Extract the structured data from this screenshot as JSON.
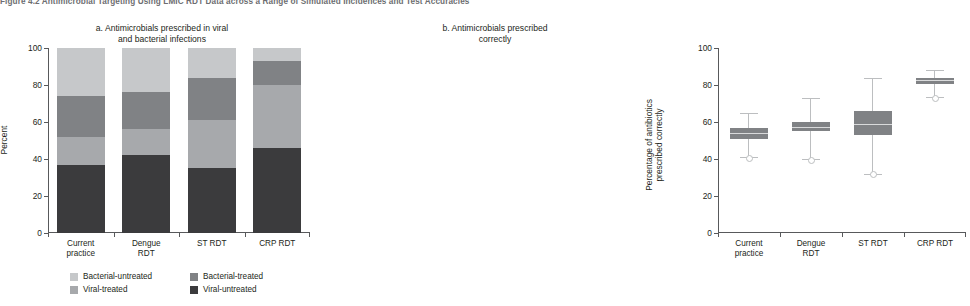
{
  "figure": {
    "title": "Figure 4.2 Antimicrobial Targeting Using LMIC RDT Data across a Range of Simulated Incidences and Test Accuracies"
  },
  "colors": {
    "bacterial_untreated": "#c6c8ca",
    "bacterial_treated": "#808285",
    "viral_treated": "#a7a9ac",
    "viral_untreated": "#3b3b3d",
    "box_fill": "#808285",
    "whisker": "#bcbec0",
    "axis": "#58595b",
    "text": "#231f20",
    "title_gray": "#6d6e71"
  },
  "legend": {
    "items": [
      {
        "label": "Bacterial-untreated",
        "color": "#c6c8ca",
        "key": "bacterial_untreated"
      },
      {
        "label": "Bacterial-treated",
        "color": "#808285",
        "key": "bacterial_treated"
      },
      {
        "label": "Viral-treated",
        "color": "#a7a9ac",
        "key": "viral_treated"
      },
      {
        "label": "Viral-untreated",
        "color": "#3b3b3d",
        "key": "viral_untreated"
      }
    ]
  },
  "chart_data": [
    {
      "id": "panel-a",
      "type": "bar",
      "title": "a. Antimicrobials prescribed in viral and bacterial infections",
      "title_line1": "a. Antimicrobials prescribed in viral",
      "title_line2": "and bacterial infections",
      "stacked": true,
      "xlabel": "",
      "ylabel": "Percent",
      "ylim": [
        0,
        100
      ],
      "yticks": [
        0,
        20,
        40,
        60,
        80,
        100
      ],
      "ytick_labels": [
        "0",
        "20",
        "40",
        "60",
        "80",
        "100"
      ],
      "grid": false,
      "legend_position": "below",
      "categories": [
        "Current practice",
        "Dengue RDT",
        "ST RDT",
        "CRP RDT"
      ],
      "category_lines": [
        [
          "Current",
          "practice"
        ],
        [
          "Dengue",
          "RDT"
        ],
        [
          "ST RDT",
          ""
        ],
        [
          "CRP RDT",
          ""
        ]
      ],
      "series": [
        {
          "name": "Viral-untreated",
          "color": "#3b3b3d",
          "values": [
            37,
            42,
            35,
            46
          ]
        },
        {
          "name": "Viral-treated",
          "color": "#a7a9ac",
          "values": [
            15,
            14,
            26,
            34
          ]
        },
        {
          "name": "Bacterial-treated",
          "color": "#808285",
          "values": [
            22,
            20,
            23,
            13
          ]
        },
        {
          "name": "Bacterial-untreated",
          "color": "#c6c8ca",
          "values": [
            26,
            24,
            16,
            7
          ]
        }
      ],
      "cumulative_tops": [
        [
          37,
          52,
          74,
          100
        ],
        [
          42,
          56,
          76,
          100
        ],
        [
          35,
          61,
          84,
          100
        ],
        [
          46,
          80,
          93,
          100
        ]
      ]
    },
    {
      "id": "panel-b",
      "type": "boxplot",
      "title": "b. Antimicrobials prescribed correctly",
      "title_line1": "b. Antimicrobials prescribed",
      "title_line2": "correctly",
      "xlabel": "",
      "ylabel": "Percentage of antibiotics prescribed correctly",
      "ylabel_line1": "Percentage of antibiotics",
      "ylabel_line2": "prescribed correctly",
      "ylim": [
        0,
        100
      ],
      "yticks": [
        0,
        20,
        40,
        60,
        80,
        100
      ],
      "ytick_labels": [
        "0",
        "20",
        "40",
        "60",
        "80",
        "100"
      ],
      "grid": false,
      "categories": [
        "Current practice",
        "Dengue RDT",
        "ST RDT",
        "CRP RDT"
      ],
      "category_lines": [
        [
          "Current",
          "practice"
        ],
        [
          "Dengue",
          "RDT"
        ],
        [
          "ST RDT",
          ""
        ],
        [
          "CRP RDT",
          ""
        ]
      ],
      "boxes": [
        {
          "category": "Current practice",
          "min": 41.0,
          "q1": 51.0,
          "median": 54.0,
          "q3": 56.5,
          "max": 65.0,
          "outlier_low": 41.0
        },
        {
          "category": "Dengue RDT",
          "min": 40.0,
          "q1": 55.0,
          "median": 57.5,
          "q3": 60.0,
          "max": 73.0,
          "outlier_low": 40.0
        },
        {
          "category": "ST RDT",
          "min": 32.0,
          "q1": 53.0,
          "median": 59.0,
          "q3": 66.0,
          "max": 84.0,
          "outlier_low": 32.0
        },
        {
          "category": "CRP RDT",
          "min": 73.5,
          "q1": 80.5,
          "median": 82.5,
          "q3": 84.0,
          "max": 88.0,
          "outlier_low": 73.5
        }
      ]
    }
  ]
}
